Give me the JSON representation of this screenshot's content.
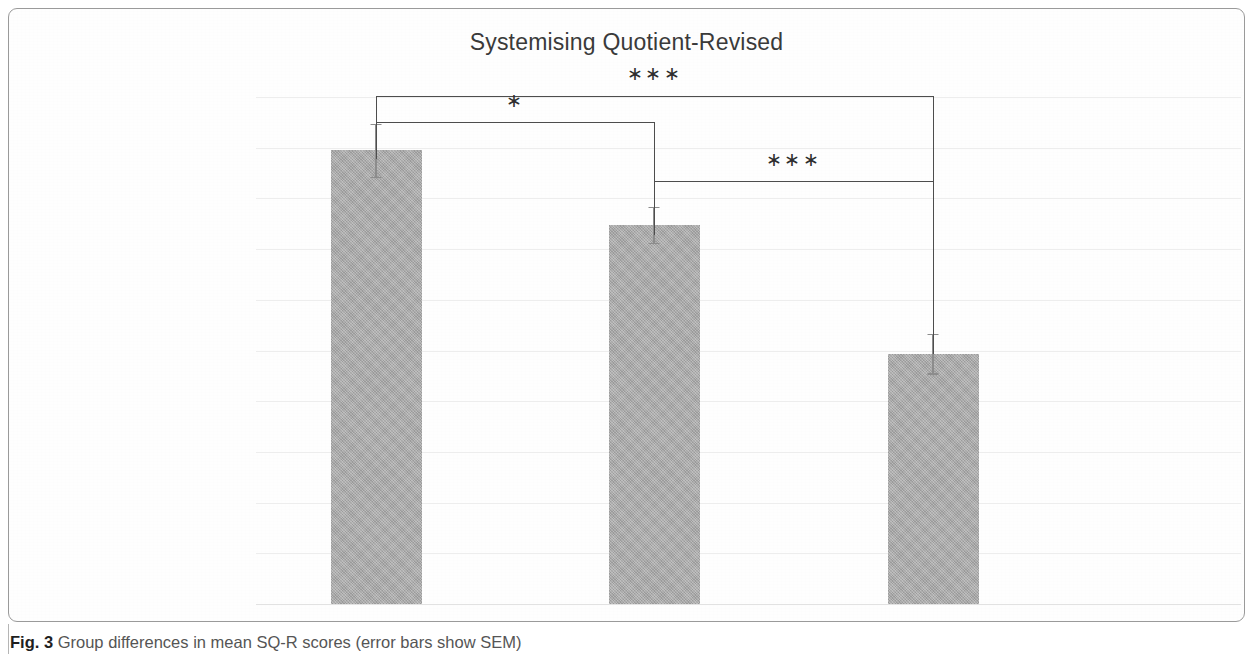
{
  "figure": {
    "number_label": "Fig. 3",
    "caption_text": "Group differences in mean SQ-R scores (error bars show SEM)"
  },
  "chart_data": {
    "type": "bar",
    "title": "Systemising Quotient-Revised",
    "xlabel": "",
    "ylabel": "",
    "ylim": [
      0,
      100
    ],
    "ytick_labels": [
      "100",
      "90",
      "80",
      "70",
      "60",
      "50",
      "40",
      "30",
      "20",
      "10",
      "0"
    ],
    "ytick_values": [
      100,
      90,
      80,
      70,
      60,
      50,
      40,
      30,
      20,
      10,
      0
    ],
    "grid": true,
    "legend": false,
    "categories": [
      "Autistic-savants",
      "Autistic-nonsavants",
      "Controls"
    ],
    "values": [
      89.5,
      74.8,
      49.4
    ],
    "errors": [
      5.2,
      3.6,
      3.9
    ],
    "error_type": "SEM",
    "bar_color": "#a9a9a9",
    "annotations": [
      {
        "name": "savants-vs-controls",
        "from": "Autistic-savants",
        "to": "Controls",
        "stars": "∗∗∗"
      },
      {
        "name": "savants-vs-nonsavants",
        "from": "Autistic-savants",
        "to": "Autistic-nonsavants",
        "stars": "∗"
      },
      {
        "name": "nonsavants-vs-controls",
        "from": "Autistic-nonsavants",
        "to": "Controls",
        "stars": "∗∗∗"
      }
    ]
  }
}
